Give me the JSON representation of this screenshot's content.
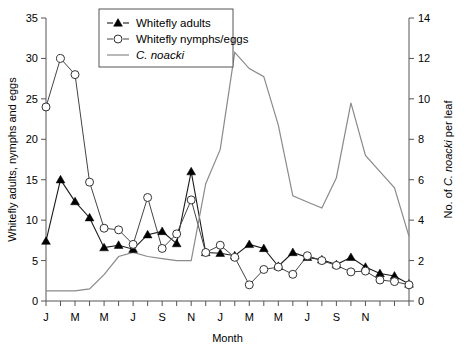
{
  "chart_data": {
    "type": "line",
    "title": "",
    "xlabel": "Month",
    "ylabel": "Whitefly adults, nymphs and eggs",
    "y2label": "No. of C. noacki per leaf",
    "ylim": [
      0,
      35
    ],
    "yticks": [
      0,
      5,
      10,
      15,
      20,
      25,
      30,
      35
    ],
    "y2lim": [
      0,
      14
    ],
    "y2ticks": [
      0,
      2,
      4,
      6,
      8,
      10,
      12,
      14
    ],
    "grid": false,
    "legend_position": "top-center",
    "x": [
      1,
      2,
      3,
      4,
      5,
      6,
      7,
      8,
      9,
      10,
      11,
      12,
      13,
      14,
      15,
      16,
      17,
      18,
      19,
      20,
      21,
      22,
      23,
      24,
      25,
      26
    ],
    "xtick_labels": [
      "J",
      "",
      "M",
      "",
      "M",
      "",
      "J",
      "",
      "S",
      "",
      "N",
      "",
      "J",
      "",
      "M",
      "",
      "M",
      "",
      "J",
      "",
      "S",
      "",
      "N",
      "",
      ""
    ],
    "xtick_labels_visible": [
      "J",
      "M",
      "M",
      "J",
      "S",
      "N",
      "J",
      "M",
      "M",
      "J",
      "S",
      "N"
    ],
    "series": [
      {
        "name": "Whitefly adults",
        "axis": "left",
        "marker": "filled-triangle",
        "values": [
          7.4,
          15.0,
          12.3,
          10.3,
          6.6,
          6.9,
          6.4,
          8.2,
          8.6,
          7.1,
          16.0,
          6.0,
          5.9,
          5.6,
          7.0,
          6.5,
          4.3,
          6.0,
          5.4,
          5.1,
          4.5,
          5.4,
          4.2,
          3.4,
          3.1,
          2.1
        ]
      },
      {
        "name": "Whitefly nymphs/eggs",
        "axis": "left",
        "marker": "open-circle",
        "values": [
          24.0,
          30.0,
          28.0,
          14.7,
          9.0,
          8.8,
          7.0,
          12.8,
          6.5,
          8.3,
          12.5,
          6.0,
          6.9,
          5.4,
          2.0,
          3.9,
          4.2,
          3.3,
          5.6,
          5.0,
          4.4,
          3.6,
          3.7,
          2.6,
          2.4,
          2.0
        ]
      },
      {
        "name": "C. noacki",
        "axis": "right",
        "marker": "none",
        "values": [
          0.5,
          0.5,
          0.5,
          0.6,
          1.3,
          2.2,
          2.4,
          2.2,
          2.1,
          2.0,
          2.0,
          5.8,
          7.5,
          12.3,
          11.5,
          11.1,
          8.7,
          5.2,
          4.9,
          4.6,
          6.1,
          9.8,
          7.2,
          6.4,
          5.6,
          3.2
        ]
      }
    ],
    "legend": [
      {
        "label": "Whitefly adults",
        "marker": "filled-triangle",
        "style": "line-marker"
      },
      {
        "label": "Whitefly nymphs/eggs",
        "marker": "open-circle",
        "style": "line-marker"
      },
      {
        "label": "C. noacki",
        "marker": "none",
        "style": "line",
        "italic": true
      }
    ]
  }
}
